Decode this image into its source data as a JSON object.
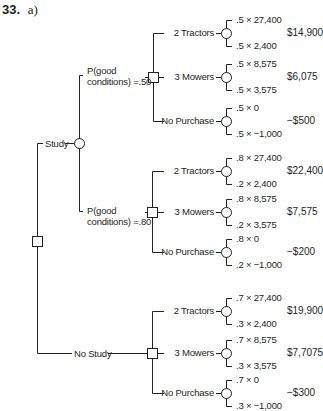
{
  "header": {
    "number": "33.",
    "part": "a)"
  },
  "root": {
    "type": "decision"
  },
  "branches": [
    {
      "label": "Study",
      "sub": [
        {
          "prob_label_line1": "P(good",
          "prob_label_line2": "conditions) =.50",
          "options": [
            {
              "label": "2 Tractors",
              "outcomes": [
                ".5 × 27,400",
                ".5 × 2,400"
              ],
              "ev": "$14,900"
            },
            {
              "label": "3 Mowers",
              "outcomes": [
                ".5 × 8,575",
                ".5 × 3,575"
              ],
              "ev": "$6,075"
            },
            {
              "label": "No Purchase",
              "outcomes": [
                ".5 × 0",
                ".5 × −1,000"
              ],
              "ev": "−$500"
            }
          ]
        },
        {
          "prob_label_line1": "P(good",
          "prob_label_line2": "conditions) =.80",
          "options": [
            {
              "label": "2 Tractors",
              "outcomes": [
                ".8 × 27,400",
                ".2 × 2,400"
              ],
              "ev": "$22,400"
            },
            {
              "label": "3 Mowers",
              "outcomes": [
                ".8 × 8,575",
                ".2 × 3,575"
              ],
              "ev": "$7,575"
            },
            {
              "label": "No Purchase",
              "outcomes": [
                ".8 × 0",
                ".2 × −1,000"
              ],
              "ev": "−$200"
            }
          ]
        }
      ]
    },
    {
      "label": "No Study",
      "options": [
        {
          "label": "2 Tractors",
          "outcomes": [
            ".7 × 27,400",
            ".3 × 2,400"
          ],
          "ev": "$19,900"
        },
        {
          "label": "3 Mowers",
          "outcomes": [
            ".7 × 8,575",
            ".3 × 3,575"
          ],
          "ev": "$7,7075"
        },
        {
          "label": "No Purchase",
          "outcomes": [
            ".7 × 0",
            ".3 × −1,000"
          ],
          "ev": "−$300"
        }
      ]
    }
  ]
}
